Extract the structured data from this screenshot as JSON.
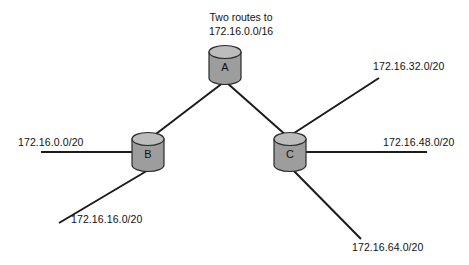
{
  "diagram": {
    "title_lines": {
      "line1": "Two routes to",
      "line2": "172.16.0.0/16"
    },
    "nodes": [
      {
        "id": "a",
        "letter": "A"
      },
      {
        "id": "b",
        "letter": "B"
      },
      {
        "id": "c",
        "letter": "C"
      }
    ],
    "network_labels": {
      "left": "172.16.0.0/20",
      "bottom_left": "172.16.16.0/20",
      "top_right": "172.16.32.0/20",
      "right": "172.16.48.0/20",
      "bottom_right": "172.16.64.0/20"
    },
    "colors": {
      "line": "#1b1b1b",
      "node_body": "#9d9d9d",
      "node_top": "#bcbcbc",
      "node_stroke": "#2a2a2a",
      "text": "#111111",
      "background": "#ffffff"
    }
  }
}
